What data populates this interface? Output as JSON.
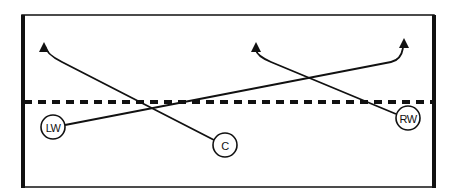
{
  "diagram": {
    "type": "play-diagram",
    "colors": {
      "line": "#111111",
      "background": "#ffffff"
    },
    "court": {
      "box": {
        "x": 22,
        "y": 15,
        "width": 412,
        "height": 172
      },
      "thick_edges": [
        "left",
        "right"
      ],
      "dashed_line": {
        "y": 102,
        "x1": 24,
        "x2": 432
      }
    },
    "players": [
      {
        "id": "LW",
        "label": "LW",
        "cx": 53,
        "cy": 127,
        "r": 12
      },
      {
        "id": "C",
        "label": "C",
        "cx": 225,
        "cy": 145,
        "r": 12
      },
      {
        "id": "RW",
        "label": "RW",
        "cx": 408,
        "cy": 118,
        "r": 12
      }
    ],
    "paths": [
      {
        "from": "C",
        "d": "M214,140 L62,62 Q46,54 45,46",
        "arrow_tip": [
          44,
          42
        ]
      },
      {
        "from": "LW",
        "d": "M65,125 L391,62 Q401,60 403,48",
        "arrow_tip": [
          404,
          38
        ]
      },
      {
        "from": "RW",
        "d": "M396,114 L271,62 Q257,56 256,50",
        "arrow_tip": [
          256,
          42
        ]
      }
    ]
  }
}
